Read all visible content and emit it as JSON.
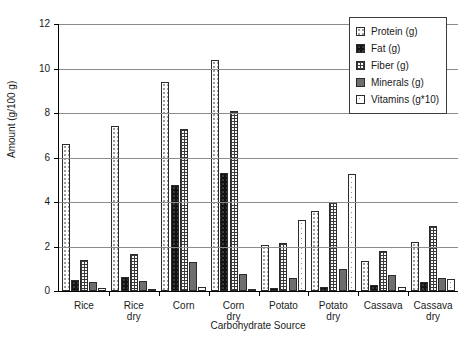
{
  "chart_data": {
    "type": "bar",
    "title": "",
    "xlabel": "Carbohydrate Source",
    "ylabel": "Amount (g/100 g)",
    "ylim": [
      0,
      12
    ],
    "yticks": [
      0,
      2,
      4,
      6,
      8,
      10,
      12
    ],
    "ytick_labels": [
      "0",
      "2",
      "4",
      "6",
      "8",
      "10",
      "12"
    ],
    "grid": "horizontal",
    "legend_position": "top-right",
    "categories": [
      "Rice",
      "Rice dry",
      "Corn",
      "Corn dry",
      "Potato",
      "Potato dry",
      "Cassava",
      "Cassava\ndry"
    ],
    "series": [
      {
        "name": "Protein (g)",
        "pattern": "fine-dotted-light",
        "values": [
          6.6,
          7.4,
          9.4,
          10.4,
          2.05,
          3.6,
          1.35,
          2.2
        ]
      },
      {
        "name": "Fat (g)",
        "pattern": "solid-black",
        "values": [
          0.5,
          0.65,
          4.75,
          5.3,
          0.15,
          0.2,
          0.25,
          0.4
        ]
      },
      {
        "name": "Fiber (g)",
        "pattern": "cross-hatch-grid",
        "values": [
          1.4,
          1.65,
          7.3,
          8.1,
          2.15,
          4.0,
          1.8,
          2.9
        ]
      },
      {
        "name": "Minerals (g)",
        "pattern": "solid-gray",
        "values": [
          0.4,
          0.45,
          1.3,
          0.75,
          0.6,
          1.0,
          0.7,
          0.6
        ]
      },
      {
        "name": "Vitamins (g*10)",
        "pattern": "coarse-dotted-light",
        "values": [
          0.15,
          0.1,
          0.2,
          0.1,
          3.2,
          5.25,
          0.2,
          0.55
        ]
      }
    ],
    "legend": [
      "Protein (g)",
      "Fat (g)",
      "Fiber (g)",
      "Minerals (g)",
      "Vitamins (g*10)"
    ]
  }
}
